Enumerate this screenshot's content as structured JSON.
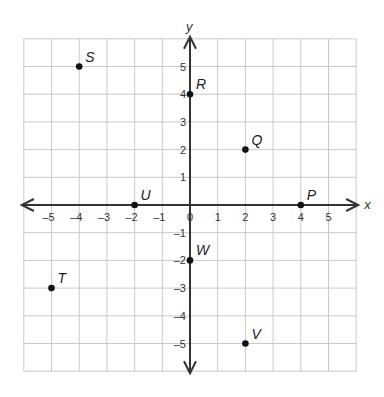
{
  "chart_data": {
    "type": "scatter",
    "title": "",
    "xlabel": "x",
    "ylabel": "y",
    "xlim": [
      -6,
      6
    ],
    "ylim": [
      -6,
      6
    ],
    "grid": true,
    "x_ticks": [
      -5,
      -4,
      -3,
      -2,
      -1,
      0,
      1,
      2,
      3,
      4,
      5
    ],
    "y_ticks": [
      -5,
      -4,
      -3,
      -2,
      -1,
      1,
      2,
      3,
      4,
      5
    ],
    "x_tick_labels": [
      "–5",
      "–4",
      "–3",
      "–2",
      "–1",
      "0",
      "1",
      "2",
      "3",
      "4",
      "5"
    ],
    "y_tick_labels": [
      "–5",
      "–4",
      "–3",
      "–2",
      "–1",
      "1",
      "2",
      "3",
      "4",
      "5"
    ],
    "points": [
      {
        "label": "S",
        "x": -4,
        "y": 5
      },
      {
        "label": "R",
        "x": 0,
        "y": 4
      },
      {
        "label": "Q",
        "x": 2,
        "y": 2
      },
      {
        "label": "P",
        "x": 4,
        "y": 0
      },
      {
        "label": "U",
        "x": -2,
        "y": 0
      },
      {
        "label": "W",
        "x": 0,
        "y": -2
      },
      {
        "label": "T",
        "x": -5,
        "y": -3
      },
      {
        "label": "V",
        "x": 2,
        "y": -5
      }
    ]
  }
}
